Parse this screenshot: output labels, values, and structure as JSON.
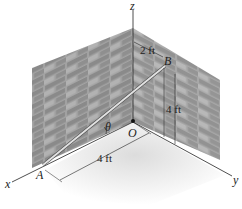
{
  "diagram": {
    "axes": {
      "x": "x",
      "y": "y",
      "z": "z"
    },
    "points": {
      "A": "A",
      "B": "B",
      "O": "O"
    },
    "angle": "θ",
    "dimensions": {
      "b_offset": "2 ft",
      "b_height": "4 ft",
      "a_distance": "4 ft"
    },
    "colors": {
      "wall": "#9c9c9c",
      "brick_dark": "#7e7e7e",
      "floor": "#e8e8e8",
      "rod": "#d8d8d8"
    }
  }
}
